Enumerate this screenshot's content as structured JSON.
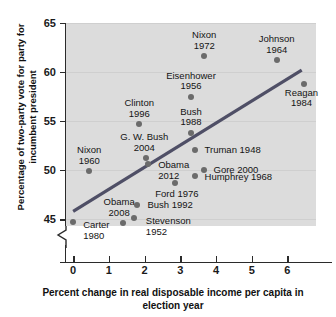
{
  "chart_data": {
    "type": "scatter",
    "title": "",
    "xlabel": "Percent change in real disposable income per capita in election year",
    "ylabel": "Percentage of two-party vote for party for incumbent president",
    "xlim": [
      -0.2,
      6.8
    ],
    "ylim": [
      44.3,
      65.0
    ],
    "xticks": [
      0,
      1,
      2,
      3,
      4,
      5,
      6
    ],
    "yticks": [
      45,
      50,
      55,
      60,
      65
    ],
    "grid": true,
    "y_axis_break": true,
    "legend": "none",
    "trendline": {
      "x0": 0.0,
      "y0": 45.8,
      "x1": 6.4,
      "y1": 60.2
    },
    "points": [
      {
        "label": "Carter\n1980",
        "x": 0.0,
        "y": 44.7,
        "lx": 10,
        "ly": -2,
        "align": "l"
      },
      {
        "label": "Nixon\n1960",
        "x": 0.45,
        "y": 49.9,
        "lx": 0,
        "ly": -26,
        "align": "c"
      },
      {
        "label": "Obama\n2008",
        "x": 1.4,
        "y": 44.6,
        "lx": -4,
        "ly": -26,
        "align": "c"
      },
      {
        "label": "Stevenson\n1952",
        "x": 1.7,
        "y": 45.1,
        "lx": 12,
        "ly": -2,
        "align": "l"
      },
      {
        "label": "Bush 1992",
        "x": 1.8,
        "y": 46.4,
        "lx": 10,
        "ly": -5,
        "align": "l"
      },
      {
        "label": "Clinton\n1996",
        "x": 1.85,
        "y": 54.7,
        "lx": 0,
        "ly": -26,
        "align": "c"
      },
      {
        "label": "G. W. Bush\n2004",
        "x": 2.05,
        "y": 51.2,
        "lx": -2,
        "ly": -26,
        "align": "c"
      },
      {
        "label": "Obama\n2012",
        "x": 2.1,
        "y": 50.6,
        "lx": 10,
        "ly": -4,
        "align": "l"
      },
      {
        "label": "Ford 1976",
        "x": 2.85,
        "y": 48.7,
        "lx": 2,
        "ly": 6,
        "align": "c"
      },
      {
        "label": "Eisenhower\n1956",
        "x": 3.3,
        "y": 57.5,
        "lx": 0,
        "ly": -26,
        "align": "c"
      },
      {
        "label": "Bush\n1988",
        "x": 3.3,
        "y": 53.8,
        "lx": 0,
        "ly": -26,
        "align": "c"
      },
      {
        "label": "Truman 1948",
        "x": 3.4,
        "y": 52.0,
        "lx": 10,
        "ly": -5,
        "align": "l"
      },
      {
        "label": "Humphrey 1968",
        "x": 3.4,
        "y": 49.4,
        "lx": 10,
        "ly": -4,
        "align": "l"
      },
      {
        "label": "Gore 2000",
        "x": 3.65,
        "y": 50.0,
        "lx": 10,
        "ly": -5,
        "align": "l"
      },
      {
        "label": "Nixon\n1972",
        "x": 3.67,
        "y": 61.6,
        "lx": 0,
        "ly": -26,
        "align": "c"
      },
      {
        "label": "Johnson\n1964",
        "x": 5.7,
        "y": 61.2,
        "lx": 0,
        "ly": -26,
        "align": "c"
      },
      {
        "label": "Reagan\n1984",
        "x": 6.45,
        "y": 58.8,
        "lx": -2,
        "ly": 4,
        "align": "c"
      }
    ]
  },
  "colors": {
    "panel": "#dcdcdc",
    "point": "#6b6b6b",
    "trendline": "#4f4f66",
    "axis": "#2b2b2b",
    "grid": "#cfcfcf"
  }
}
